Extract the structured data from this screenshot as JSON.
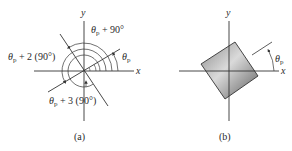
{
  "panel_a": {
    "caption": "(a)",
    "x_axis_label": "x",
    "y_axis_label": "y",
    "angle_labels": {
      "theta_p": "θ",
      "theta_p_sub": "p",
      "plus_90_suffix": " + 90°",
      "plus_2_90_suffix": " + 2 (90°)",
      "plus_3_90_suffix": " + 3 (90°)"
    }
  },
  "panel_b": {
    "caption": "(b)",
    "x_axis_label": "x",
    "y_axis_label": "y",
    "angle_label": "θ",
    "angle_label_sub": "p"
  },
  "colors": {
    "line": "#333333",
    "square_light": "#d4d4d4",
    "square_dark": "#6e6e6e",
    "text": "#2a2a2a"
  }
}
